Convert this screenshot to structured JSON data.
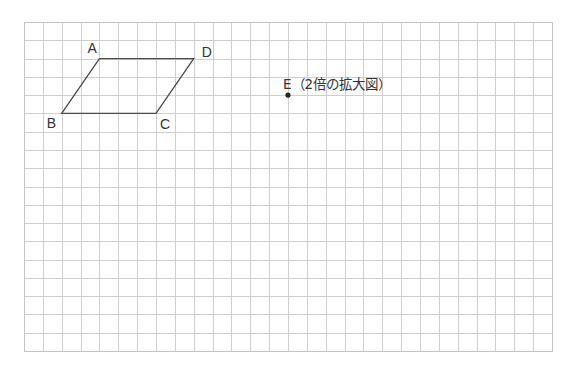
{
  "diagram": {
    "type": "grid-geometry",
    "grid": {
      "origin_px": [
        24,
        22
      ],
      "cols": 28,
      "rows": 18,
      "cell_w_px": 18.857,
      "cell_h_px": 18.28,
      "line_color": "#cfcfcf",
      "border_color": "#c4c4c4"
    },
    "parallelogram": {
      "name": "ABCD",
      "edge_color": "#4a4a4a",
      "vertices": [
        {
          "id": "A",
          "label": "A",
          "col": 4,
          "row": 2,
          "label_dx": -12,
          "label_dy": -6
        },
        {
          "id": "D",
          "label": "D",
          "col": 9,
          "row": 2,
          "label_dx": 8,
          "label_dy": -2
        },
        {
          "id": "C",
          "label": "C",
          "col": 7,
          "row": 5,
          "label_dx": 4,
          "label_dy": 16
        },
        {
          "id": "B",
          "label": "B",
          "col": 2,
          "row": 5,
          "label_dx": -15,
          "label_dy": 15
        }
      ]
    },
    "point_E": {
      "label": "E（2倍の拡大図）",
      "col": 14,
      "row": 4,
      "label_dx": -5,
      "label_dy": -6,
      "dot_color": "#222222"
    }
  }
}
